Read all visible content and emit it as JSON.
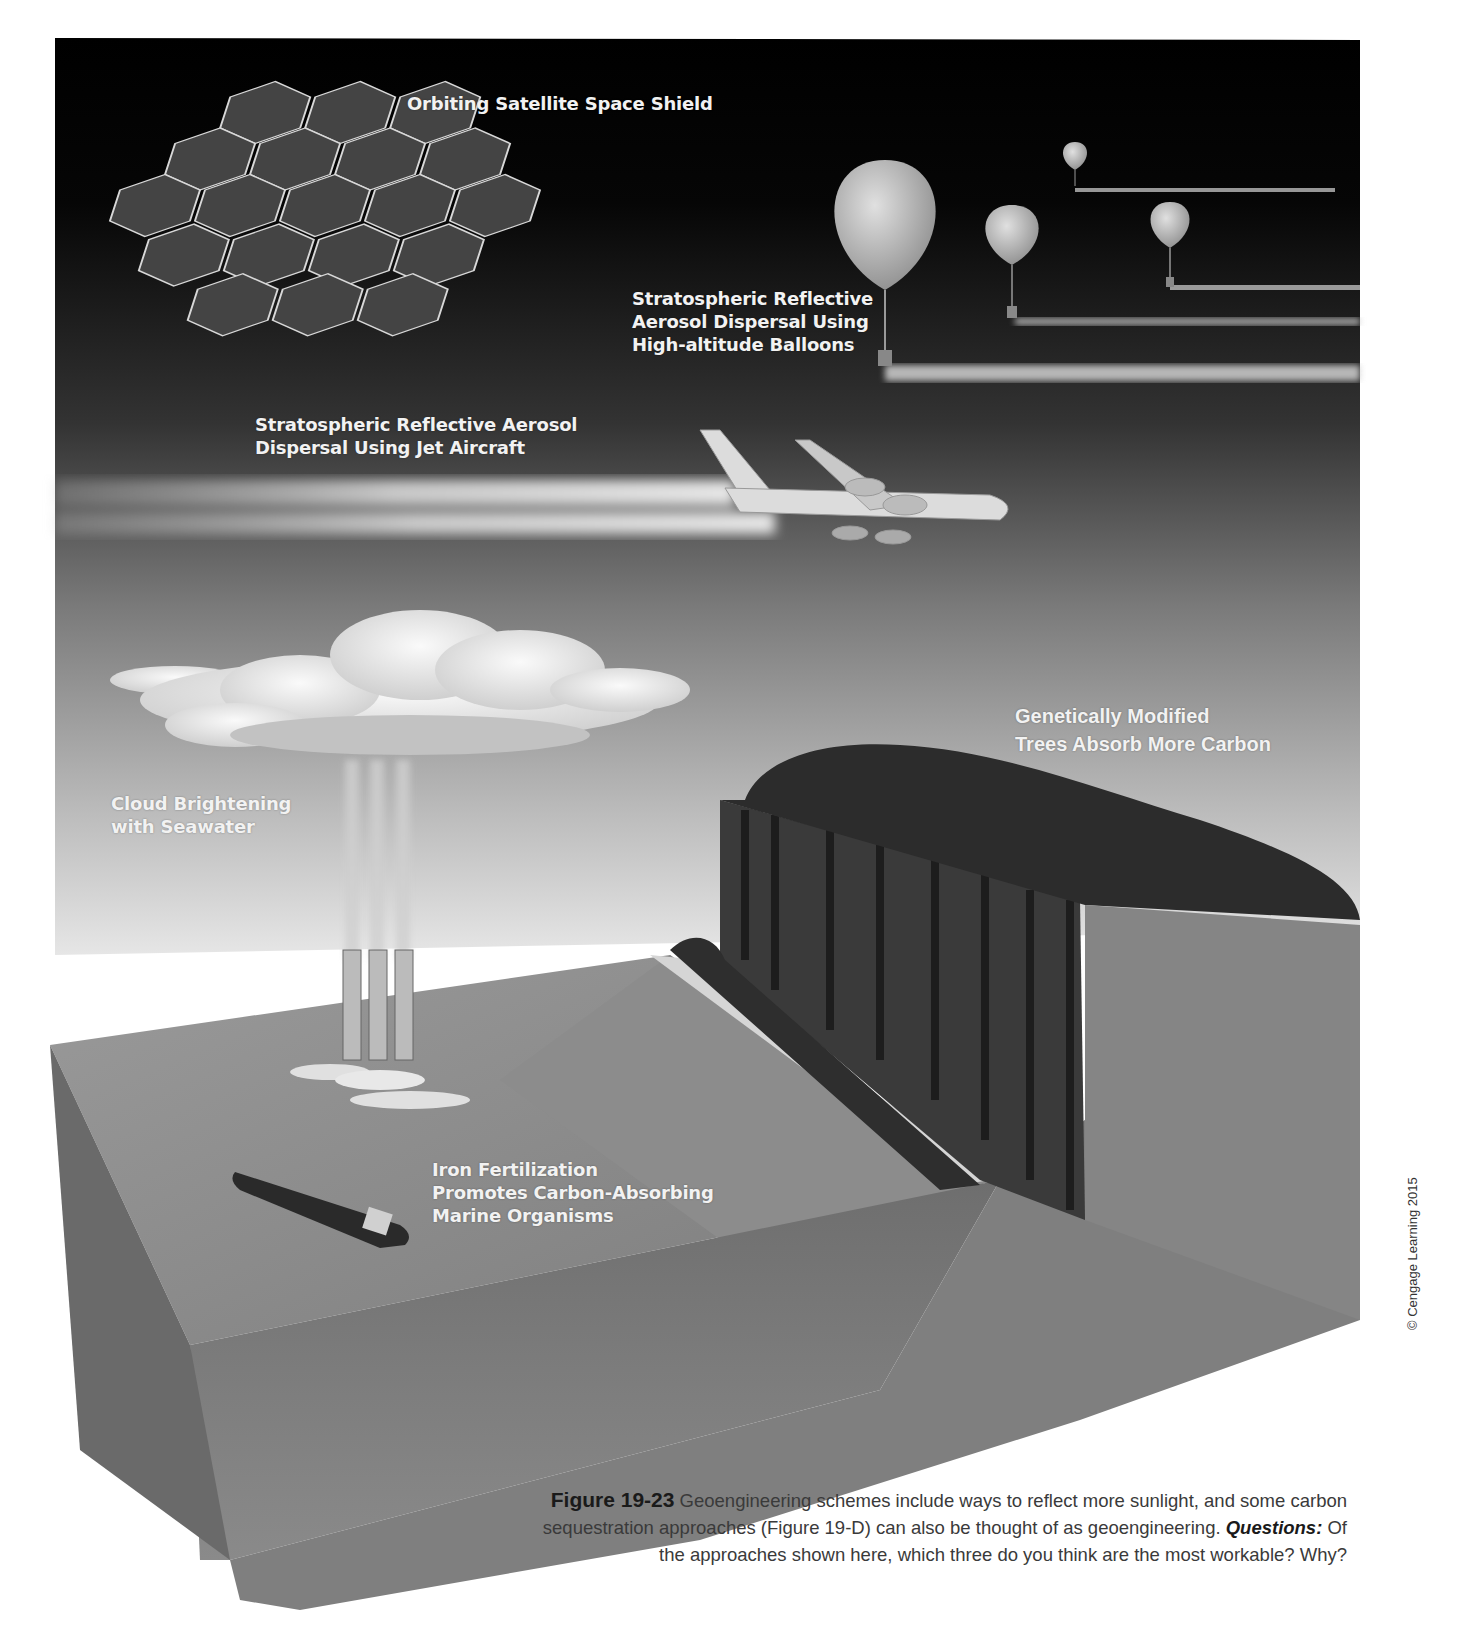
{
  "figure": {
    "labels": {
      "space_shield": "Orbiting Satellite Space Shield",
      "balloons": "Stratospheric Reflective\nAerosol Dispersal Using\nHigh-altitude Balloons",
      "jet_aircraft": "Stratospheric Reflective Aerosol\nDispersal Using Jet Aircraft",
      "gm_trees": "Genetically  Modified\nTrees Absorb More Carbon",
      "cloud_brightening": "Cloud Brightening\nwith Seawater",
      "iron_fertilization": "Iron Fertilization\nPromotes Carbon-Absorbing\nMarine Organisms"
    },
    "caption": {
      "figure_number": "Figure 19-23",
      "text_part1": " Geoengineering schemes include ways to reflect more sunlight, and some carbon sequestration approaches (Figure 19-D) can also be thought of as geoengineering. ",
      "questions_label": "Questions:",
      "text_part2": " Of the approaches shown here, which three do you think are the most workable? Why?"
    },
    "copyright": "© Cengage Learning 2015",
    "colors": {
      "sky_top": "#000000",
      "sky_mid": "#3a3a3a",
      "sky_bottom": "#d8d8d8",
      "ocean": "#8a8a8a",
      "forest": "#2e2e2e",
      "rock": "#7a7a7a",
      "label_text": "#f2f2f2",
      "caption_text": "#3a3a3a"
    }
  }
}
